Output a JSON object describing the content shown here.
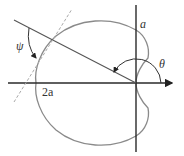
{
  "diagram": {
    "type": "polar cardioid",
    "curve": "r = a(1 - cos θ)",
    "labels": {
      "psi": "ψ",
      "theta": "θ",
      "a": "a",
      "two_a": "2a"
    },
    "colors": {
      "curve": "#8a8a8a",
      "axes": "#2a2a2a",
      "radius_line": "#555555",
      "tangent_line": "#aaaaaa",
      "arcs": "#333333"
    }
  }
}
